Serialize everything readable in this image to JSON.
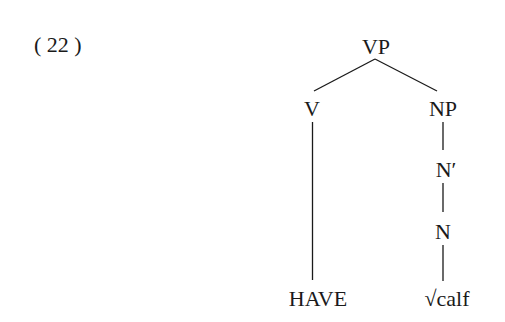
{
  "example": {
    "number_label": "( 22 )"
  },
  "tree": {
    "nodes": {
      "vp": "VP",
      "v": "V",
      "np": "NP",
      "nbar": "N′",
      "n": "N",
      "have": "HAVE",
      "calf": "√calf"
    },
    "edges": [
      [
        "VP",
        "V"
      ],
      [
        "VP",
        "NP"
      ],
      [
        "V",
        "HAVE"
      ],
      [
        "NP",
        "N′"
      ],
      [
        "N′",
        "N"
      ],
      [
        "N",
        "√calf"
      ]
    ]
  }
}
